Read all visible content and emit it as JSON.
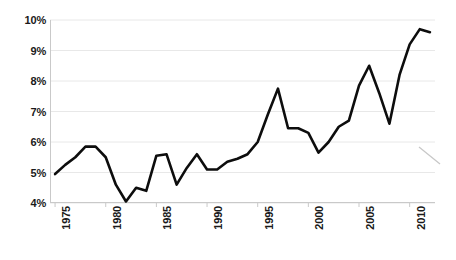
{
  "chart_data": {
    "type": "line",
    "title": "",
    "subtitle": "",
    "xlabel": "",
    "ylabel": "",
    "xlim": [
      1974.5,
      2012.5
    ],
    "ylim": [
      4,
      10
    ],
    "grid": true,
    "legend_position": "none",
    "y_ticks": [
      4,
      5,
      6,
      7,
      8,
      9,
      10
    ],
    "y_tick_labels": [
      "4%",
      "5%",
      "6%",
      "7%",
      "8%",
      "9%",
      "10%"
    ],
    "x_ticks": [
      1975,
      1980,
      1985,
      1990,
      1995,
      2000,
      2005,
      2010
    ],
    "x_tick_labels": [
      "1975",
      "1980",
      "1985",
      "1990",
      "1995",
      "2000",
      "2005",
      "2010"
    ],
    "series": [
      {
        "name": "value",
        "color": "#0d0d0d",
        "line_width": 2.6,
        "x": [
          1975,
          1976,
          1977,
          1978,
          1979,
          1980,
          1981,
          1982,
          1983,
          1984,
          1985,
          1986,
          1987,
          1988,
          1989,
          1990,
          1991,
          1992,
          1993,
          1994,
          1995,
          1996,
          1997,
          1998,
          1999,
          2000,
          2001,
          2002,
          2003,
          2004,
          2005,
          2006,
          2007,
          2008,
          2009,
          2010,
          2011,
          2012
        ],
        "values": [
          4.95,
          5.25,
          5.5,
          5.85,
          5.85,
          5.5,
          4.6,
          4.05,
          4.5,
          4.4,
          5.55,
          5.6,
          4.6,
          5.15,
          5.6,
          5.1,
          5.1,
          5.35,
          5.45,
          5.6,
          6.0,
          6.9,
          7.75,
          6.45,
          6.45,
          6.3,
          5.65,
          6.0,
          6.5,
          6.7,
          7.85,
          8.5,
          7.6,
          6.6,
          8.2,
          9.2,
          9.7,
          9.6
        ]
      }
    ],
    "annotations": [
      {
        "name": "stray-mark",
        "type": "faint-diagonal-stroke",
        "color": "#9a9a9a",
        "x1": 419,
        "y1": 147,
        "x2": 440,
        "y2": 164
      }
    ],
    "style": {
      "background": "#ffffff",
      "grid_color": "#e8e8e8",
      "axis_color": "#c9c9c9",
      "tick_label_color": "#1a1a1a"
    }
  }
}
